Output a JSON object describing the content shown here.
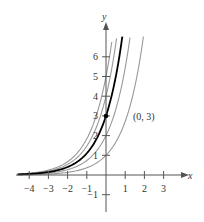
{
  "chart_data": {
    "type": "line",
    "title": "",
    "xlabel": "x",
    "ylabel": "y",
    "xlim": [
      -4.6,
      3.6
    ],
    "ylim": [
      -1.5,
      7
    ],
    "x_ticks": [
      -4,
      -3,
      -2,
      -1,
      1,
      2,
      3
    ],
    "y_ticks": [
      -1,
      1,
      2,
      3,
      4,
      5,
      6
    ],
    "x_tick_labels": [
      "−4",
      "−3",
      "−2",
      "−1",
      "1",
      "2",
      "3"
    ],
    "y_tick_labels": [
      "−1",
      "1",
      "2",
      "3",
      "4",
      "5",
      "6"
    ],
    "grid": false,
    "legend": null,
    "series": [
      {
        "name": "highlighted curve",
        "color": "#000000",
        "y_intercept": 3,
        "formula": "y = 3e^x"
      },
      {
        "name": "family curve 1",
        "color": "#999999",
        "y_intercept": 1,
        "formula": "y = e^x"
      },
      {
        "name": "family curve 2",
        "color": "#999999",
        "y_intercept": 2,
        "formula": "y = 2e^x"
      },
      {
        "name": "family curve 3",
        "color": "#999999",
        "y_intercept": 4,
        "formula": "y = 4e^x"
      },
      {
        "name": "family curve 4",
        "color": "#999999",
        "y_intercept": 5,
        "formula": "y = 5e^x"
      }
    ],
    "annotations": [
      {
        "text": "(0, 3)",
        "x": 0,
        "y": 3,
        "marker": "point"
      }
    ]
  },
  "labels": {
    "x_axis": "x",
    "y_axis": "y",
    "point": "(0, 3)",
    "xt": [
      "−4",
      "−3",
      "−2",
      "−1",
      "1",
      "2",
      "3"
    ],
    "yt": [
      "−1",
      "1",
      "2",
      "3",
      "4",
      "5",
      "6"
    ]
  }
}
